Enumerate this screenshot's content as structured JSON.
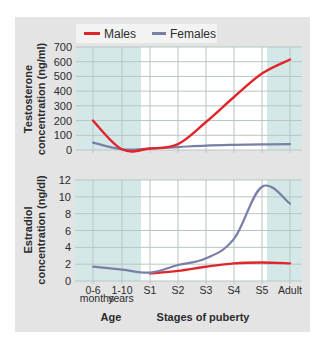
{
  "legend": {
    "males_label": "Males",
    "females_label": "Females",
    "males_color": "#e0262a",
    "females_color": "#7a7fa6"
  },
  "x_axis": {
    "categories": [
      "0-6",
      "1-10",
      "S1",
      "S2",
      "S3",
      "S4",
      "S5",
      "Adult"
    ],
    "sub_labels": [
      "months",
      "years"
    ],
    "group_labels": {
      "age": "Age",
      "puberty": "Stages of puberty"
    }
  },
  "chart_data": [
    {
      "type": "line",
      "title": "",
      "ylabel": "Testosterone concentration (ng/ml)",
      "ylabel_line1": "Testosterone",
      "ylabel_line2": "concentration (ng/ml)",
      "ylim": [
        0,
        700
      ],
      "yticks": [
        0,
        100,
        200,
        300,
        400,
        500,
        600,
        700
      ],
      "categories": [
        "0-6 months",
        "1-10 years",
        "S1",
        "S2",
        "S3",
        "S4",
        "S5",
        "Adult"
      ],
      "grid": true,
      "shaded_regions": [
        "0-6 months to 1-10 years (Age)",
        "Adult"
      ],
      "series": [
        {
          "name": "Males",
          "values": [
            200,
            5,
            10,
            40,
            190,
            360,
            520,
            615
          ]
        },
        {
          "name": "Females",
          "values": [
            50,
            5,
            10,
            20,
            30,
            35,
            38,
            40
          ]
        }
      ]
    },
    {
      "type": "line",
      "title": "",
      "ylabel": "Estradiol concentration (ng/dl)",
      "ylabel_line1": "Estradiol",
      "ylabel_line2": "concentration (ng/dl)",
      "ylim": [
        0,
        12
      ],
      "yticks": [
        0,
        2,
        4,
        6,
        8,
        10,
        12
      ],
      "categories": [
        "0-6 months",
        "1-10 years",
        "S1",
        "S2",
        "S3",
        "S4",
        "S5",
        "Adult"
      ],
      "grid": true,
      "shaded_regions": [
        "0-6 months to 1-10 years (Age)",
        "Adult"
      ],
      "series": [
        {
          "name": "Males",
          "values": [
            null,
            null,
            0.9,
            1.2,
            1.7,
            2.1,
            2.2,
            2.1
          ]
        },
        {
          "name": "Females",
          "values": [
            1.7,
            1.35,
            1.0,
            1.9,
            2.7,
            5.0,
            11.2,
            9.2
          ]
        }
      ]
    }
  ],
  "layout": {
    "x_positions": [
      93,
      122,
      150,
      178,
      206,
      234,
      262,
      290
    ],
    "top_plot": {
      "left": 76,
      "right": 302,
      "top": 47,
      "bottom": 150
    },
    "bottom_plot": {
      "left": 75,
      "right": 302,
      "top": 180,
      "bottom": 281
    },
    "left_shade_end": 141,
    "right_shade_start": 267,
    "shade_color": "#d5e8e8",
    "grid_color": "#b9c4c6"
  }
}
